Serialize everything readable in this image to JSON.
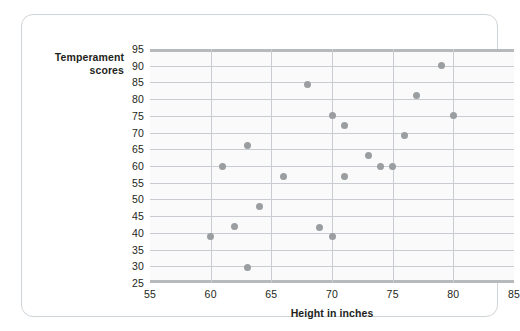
{
  "figure": {
    "y_axis_title_line1": "Temperament",
    "y_axis_title_line2": "scores",
    "x_axis_title": "Height in inches"
  },
  "chart_data": {
    "type": "scatter",
    "title": "",
    "xlabel": "Height in inches",
    "ylabel": "Temperament scores",
    "xlim": [
      55,
      85
    ],
    "ylim": [
      25,
      95
    ],
    "xticks": [
      55,
      60,
      65,
      70,
      75,
      80,
      85
    ],
    "yticks": [
      25,
      30,
      35,
      40,
      45,
      50,
      55,
      60,
      65,
      70,
      75,
      80,
      85,
      90,
      95
    ],
    "grid": "both",
    "legend": "none",
    "marker_color": "#9a9ea1",
    "points": [
      {
        "x": 60,
        "y": 39
      },
      {
        "x": 61,
        "y": 60
      },
      {
        "x": 62,
        "y": 42
      },
      {
        "x": 63,
        "y": 66
      },
      {
        "x": 63,
        "y": 29.5
      },
      {
        "x": 64,
        "y": 48
      },
      {
        "x": 66,
        "y": 57
      },
      {
        "x": 68,
        "y": 84.5
      },
      {
        "x": 69,
        "y": 41.5
      },
      {
        "x": 70,
        "y": 75
      },
      {
        "x": 70,
        "y": 39
      },
      {
        "x": 71,
        "y": 72
      },
      {
        "x": 71,
        "y": 57
      },
      {
        "x": 73,
        "y": 63
      },
      {
        "x": 74,
        "y": 60
      },
      {
        "x": 75,
        "y": 60
      },
      {
        "x": 76,
        "y": 69
      },
      {
        "x": 77,
        "y": 81
      },
      {
        "x": 79,
        "y": 90
      },
      {
        "x": 80,
        "y": 75
      }
    ]
  }
}
